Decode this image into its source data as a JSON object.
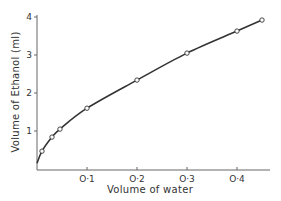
{
  "chart_data": {
    "type": "line",
    "title": "",
    "xlabel": "Volume of water",
    "ylabel": "Volume of Ethanol (ml)",
    "xlim": [
      0,
      0.47
    ],
    "ylim": [
      0,
      4
    ],
    "x_ticks": [
      "O·1",
      "O·2",
      "O·3",
      "O·4"
    ],
    "x_tick_values": [
      0.1,
      0.2,
      0.3,
      0.4
    ],
    "y_ticks": [
      "1",
      "2",
      "3",
      "4"
    ],
    "y_tick_values": [
      1,
      2,
      3,
      4
    ],
    "grid": false,
    "legend": null,
    "series": [
      {
        "name": "measured",
        "marker": "open-circle",
        "line": "smooth-curve",
        "x": [
          0.01,
          0.03,
          0.046,
          0.1,
          0.2,
          0.3,
          0.4,
          0.45
        ],
        "y": [
          0.47,
          0.84,
          1.05,
          1.6,
          2.34,
          3.05,
          3.63,
          3.92
        ]
      }
    ],
    "curve_start": {
      "x": 0.0,
      "y": 0.15
    }
  },
  "colors": {
    "axis": "#666666",
    "line": "#333333",
    "marker_fill": "#ffffff"
  }
}
